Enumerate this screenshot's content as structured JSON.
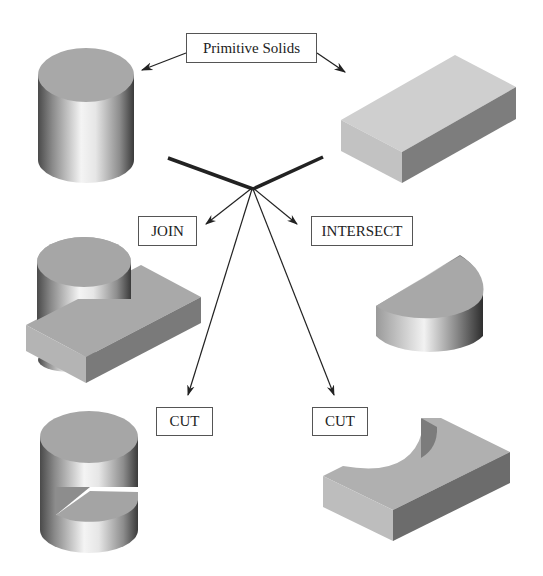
{
  "diagram": {
    "title_label": "Primitive Solids",
    "operations": {
      "join": "JOIN",
      "intersect": "INTERSECT",
      "cut_left": "CUT",
      "cut_right": "CUT"
    },
    "solids": [
      {
        "id": "primitive-cylinder",
        "description": "Primitive cylinder"
      },
      {
        "id": "primitive-box",
        "description": "Primitive rectangular block"
      },
      {
        "id": "join-result",
        "description": "Cylinder joined with block"
      },
      {
        "id": "intersect-result",
        "description": "Half-cylinder from intersection"
      },
      {
        "id": "cut-cylinder-result",
        "description": "Cylinder with block cut out"
      },
      {
        "id": "cut-box-result",
        "description": "Block with cylindrical cut"
      }
    ],
    "colors": {
      "line": "#222222",
      "box_border": "#555555",
      "top_face": "#a9a9a9",
      "box_front": "#c4c4c4",
      "box_side": "#6f6f6f"
    }
  }
}
